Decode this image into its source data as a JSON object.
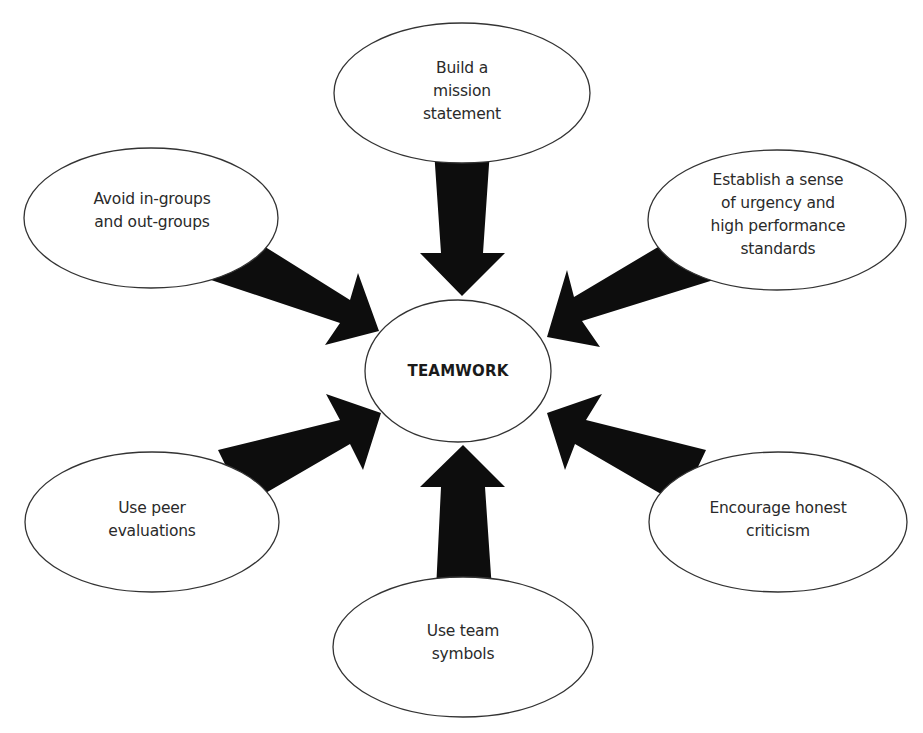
{
  "diagram": {
    "type": "hub-and-spoke",
    "colors": {
      "arrow_fill": "#0d0d0d",
      "ellipse_stroke": "#333333",
      "background": "#ffffff"
    },
    "center": {
      "label": "TEAMWORK"
    },
    "nodes": [
      {
        "id": "top",
        "label": "Build a\nmission\nstatement"
      },
      {
        "id": "top-left",
        "label": "Avoid in-groups\nand out-groups"
      },
      {
        "id": "top-right",
        "label": "Establish a sense\nof urgency and\nhigh performance\nstandards"
      },
      {
        "id": "bottom-left",
        "label": "Use peer\nevaluations"
      },
      {
        "id": "bottom-right",
        "label": "Encourage honest\ncriticism"
      },
      {
        "id": "bottom",
        "label": "Use team\nsymbols"
      }
    ]
  }
}
